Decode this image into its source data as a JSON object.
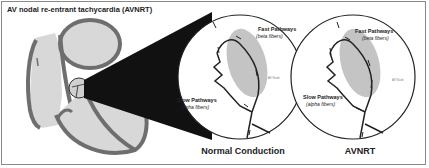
{
  "title": "AV nodal re-entrant tachycardia (AVNRT)",
  "panels": [
    {
      "caption": "Normal Conduction",
      "fast_label": "Fast Pathways",
      "fast_sub": "(beta fibers)",
      "slow_label": "Slow Pathways",
      "slow_sub": "(alpha fibers)",
      "node_label": "AV Node"
    },
    {
      "caption": "AVNRT",
      "fast_label": "Fast Pathways",
      "fast_sub": "(beta fibers)",
      "slow_label": "Slow Pathways",
      "slow_sub": "(alpha fibers)",
      "node_label": "AV Node"
    }
  ],
  "colors": {
    "heart_wall": "#6e6e6e",
    "heart_fill": "#d8d8d8",
    "node_fill": "#c4c4c4",
    "zoom_cone": "#111111",
    "frame": "#8a8a8a"
  }
}
